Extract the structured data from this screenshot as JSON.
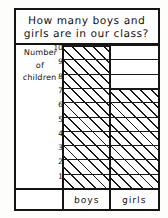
{
  "worksheet": {
    "title": "How many boys and girls are in our class?",
    "title_line_1": "How many boys and",
    "title_line_2": "girls are in our class?",
    "axis_caption": {
      "line_1": "Number",
      "line_2": "of",
      "line_3": "children"
    }
  },
  "chart_data": {
    "type": "bar",
    "title": "How many boys and girls are in our class?",
    "categories": [
      "boys",
      "girls"
    ],
    "values": [
      10,
      7
    ],
    "xlabel": "",
    "ylabel": "Number of children",
    "ylim": [
      0,
      10
    ],
    "yticks": [
      1,
      2,
      3,
      4,
      5,
      6,
      7,
      8,
      9,
      10
    ],
    "ytick_labels": [
      "1",
      "2",
      "3",
      "4",
      "5",
      "6",
      "7",
      "8",
      "9",
      "10"
    ],
    "grid": true,
    "legend": false,
    "bar_fill": "diagonal-hatch",
    "colors": {
      "ink": "#141414",
      "paper": "#ffffff"
    }
  }
}
